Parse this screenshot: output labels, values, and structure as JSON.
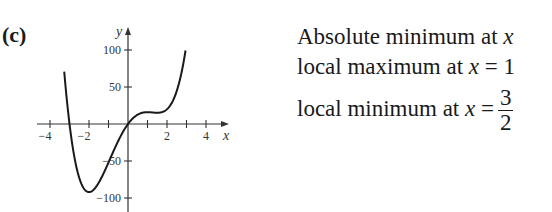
{
  "panel_label": "(c)",
  "notes": {
    "line1": {
      "text": "Absolute minimum at ",
      "var": "x"
    },
    "line2": {
      "text": "local maximum at ",
      "var": "x",
      "eq": " = 1"
    },
    "line3": {
      "text": "local minimum at ",
      "var": "x",
      "eq": " =",
      "frac_num": "3",
      "frac_den": "2"
    }
  },
  "chart_data": {
    "type": "line",
    "title": "",
    "xlabel": "x",
    "ylabel": "y",
    "xlim": [
      -4.5,
      4.8
    ],
    "ylim": [
      -110,
      130
    ],
    "x_ticks": [
      -4,
      -3,
      -2,
      -1,
      1,
      2,
      3,
      4
    ],
    "x_tick_labels": {
      "-4": "−4",
      "-2": "−2",
      "2": "2",
      "4": "4"
    },
    "y_ticks": [
      100,
      50,
      -50,
      -100
    ],
    "y_tick_labels": {
      "100": "100",
      "50": "50",
      "-50": "−50",
      "-100": "−100"
    },
    "grid": false,
    "function": "3x^4 - 2x^3 - 21x^2 + 36x",
    "coefficients": [
      3,
      -2,
      -21,
      36,
      0
    ],
    "series": [
      {
        "name": "f(x)",
        "x": [
          -3.25,
          -3.0,
          -2.5,
          -2.0,
          -1.5,
          -1.0,
          -0.5,
          0,
          0.5,
          1.0,
          1.5,
          2.0,
          2.5,
          2.95
        ],
        "values": [
          38.2,
          0,
          -69.4,
          -92,
          -79.3,
          -52,
          -23.1,
          0,
          12.5,
          16,
          15.2,
          28,
          74.4,
          124.5
        ]
      }
    ],
    "annotations": {
      "absolute_min_x": -2,
      "local_max_x": 1,
      "local_min_x": 1.5
    },
    "axis_color": "#333333",
    "curve_color": "#1a1a1a"
  }
}
